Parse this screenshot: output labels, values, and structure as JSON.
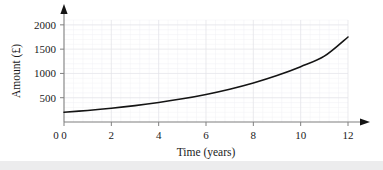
{
  "figure": {
    "background_color": "#ffffff",
    "bottom_strip_color": "#ececed"
  },
  "chart_data": {
    "type": "line",
    "title": "",
    "subtitle": "",
    "xlabel": "Time (years)",
    "ylabel": "Amount (£)",
    "xlim": [
      0,
      12
    ],
    "ylim": [
      0,
      2100
    ],
    "xticks": [
      0,
      2,
      4,
      6,
      8,
      10,
      12
    ],
    "xtick_labels": [
      "0",
      "2",
      "4",
      "6",
      "8",
      "10",
      "12"
    ],
    "yticks": [
      500,
      1000,
      1500,
      2000
    ],
    "ytick_labels": [
      "500",
      "1000",
      "1500",
      "2000"
    ],
    "grid": true,
    "grid_major_color": "#e3e3e8",
    "grid_minor_color": "#f1f1f4",
    "grid_minor_step_x": 0.4,
    "grid_minor_step_y": 100,
    "legend": null,
    "legend_position": "none",
    "axis_color": "#808080",
    "axis_arrows": true,
    "series": [
      {
        "name": "Amount",
        "color": "#141414",
        "line_width": 1.6,
        "x": [
          0,
          1,
          2,
          3,
          4,
          5,
          6,
          7,
          8,
          9,
          10,
          11,
          12
        ],
        "values": [
          200,
          238,
          283,
          337,
          401,
          477,
          568,
          676,
          804,
          957,
          1139,
          1355,
          1750
        ]
      }
    ],
    "annotations": []
  },
  "axis_labels": {
    "y_axis_title": "Amount (£)",
    "x_axis_title": "Time (years)"
  }
}
